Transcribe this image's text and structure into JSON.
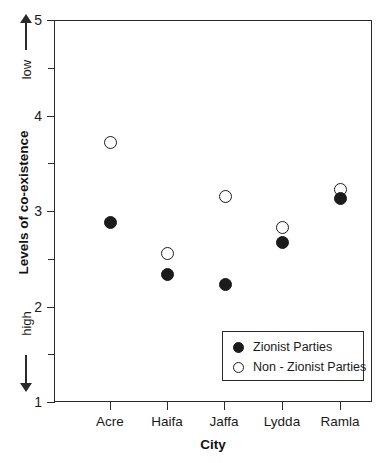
{
  "chart_data": {
    "type": "scatter",
    "title": "",
    "xlabel": "City",
    "ylabel": "Levels of co-existence",
    "categories": [
      "Acre",
      "Haifa",
      "Jaffa",
      "Lydda",
      "Ramla"
    ],
    "series": [
      {
        "name": "Zionist Parties",
        "marker": "filled-circle",
        "values": [
          2.88,
          2.33,
          2.23,
          2.67,
          3.13
        ]
      },
      {
        "name": "Non - Zionist Parties",
        "marker": "open-circle",
        "values": [
          3.72,
          2.55,
          3.15,
          2.83,
          3.22
        ]
      }
    ],
    "ylim": [
      1,
      5
    ],
    "y_major_ticks": [
      "5",
      "4",
      "3",
      "2",
      "1"
    ],
    "y_major_values": [
      5,
      4,
      3,
      2,
      1
    ],
    "y_minor_values": [
      4.5,
      3.5,
      2.5,
      1.5
    ],
    "grid": false,
    "legend_position": "inside-bottom-right",
    "scale_annotations": {
      "top_label": "low",
      "bottom_label": "high",
      "top_arrow": "arrow-up",
      "bottom_arrow": "arrow-down"
    },
    "colors": {
      "marker_filled": "#1b1b1b",
      "marker_open_stroke": "#1b1b1b",
      "marker_open_fill": "#ffffff",
      "axis": "#2a2a2a",
      "background": "#ffffff",
      "text": "#1a1a1a"
    }
  },
  "legend": {
    "entries": [
      {
        "label": "Zionist Parties",
        "marker": "filled-circle"
      },
      {
        "label": "Non - Zionist Parties",
        "marker": "open-circle"
      }
    ]
  },
  "axis": {
    "x_title": "City",
    "y_title": "Levels of co-existence"
  }
}
